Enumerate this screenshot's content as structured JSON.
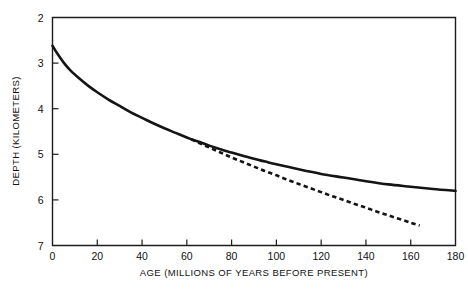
{
  "chart_data": {
    "type": "line",
    "title": "",
    "xlabel": "AGE (MILLIONS OF YEARS BEFORE PRESENT)",
    "ylabel": "DEPTH (KILOMETERS)",
    "xlim": [
      0,
      180
    ],
    "ylim": [
      2,
      7
    ],
    "y_axis_inverted": true,
    "grid": false,
    "legend": "none",
    "xticks": [
      0,
      20,
      40,
      60,
      80,
      100,
      120,
      140,
      160,
      180
    ],
    "xtick_labels": [
      "0",
      "20",
      "40",
      "60",
      "80",
      "100",
      "120",
      "140",
      "160",
      "180"
    ],
    "yticks": [
      2,
      3,
      4,
      5,
      6,
      7
    ],
    "ytick_labels": [
      "2",
      "3",
      "4",
      "5",
      "6",
      "7"
    ],
    "tick_direction": "in",
    "series": [
      {
        "name": "plate-model-depth",
        "style": "solid",
        "color": "#141414",
        "x": [
          0,
          2,
          5,
          8,
          12,
          16,
          20,
          25,
          30,
          35,
          40,
          45,
          50,
          55,
          60,
          62,
          65,
          70,
          75,
          80,
          85,
          90,
          95,
          100,
          110,
          120,
          130,
          140,
          150,
          160,
          170,
          180
        ],
        "y": [
          2.62,
          2.78,
          2.99,
          3.16,
          3.34,
          3.5,
          3.64,
          3.8,
          3.94,
          4.08,
          4.2,
          4.32,
          4.43,
          4.53,
          4.63,
          4.67,
          4.72,
          4.81,
          4.89,
          4.96,
          5.03,
          5.1,
          5.16,
          5.22,
          5.33,
          5.43,
          5.51,
          5.59,
          5.66,
          5.71,
          5.76,
          5.8
        ]
      },
      {
        "name": "halfspace-cooling-depth",
        "style": "dashed",
        "color": "#141414",
        "x": [
          62,
          65,
          70,
          75,
          80,
          85,
          90,
          95,
          100,
          105,
          110,
          115,
          120,
          125,
          130,
          135,
          140,
          145,
          150,
          155,
          160,
          164
        ],
        "y": [
          4.67,
          4.74,
          4.85,
          4.96,
          5.07,
          5.17,
          5.27,
          5.37,
          5.46,
          5.56,
          5.65,
          5.74,
          5.83,
          5.92,
          6.0,
          6.09,
          6.17,
          6.26,
          6.34,
          6.42,
          6.5,
          6.56
        ]
      }
    ],
    "annotations": []
  },
  "axes": {
    "x_title": "AGE (MILLIONS OF YEARS BEFORE PRESENT)",
    "y_title": "DEPTH (KILOMETERS)"
  }
}
